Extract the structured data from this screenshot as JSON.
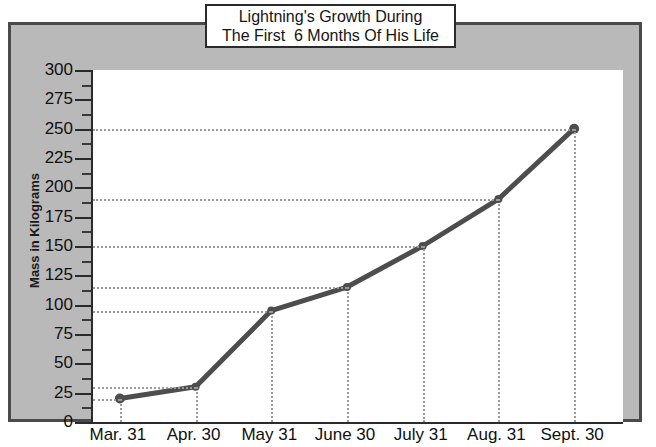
{
  "chart_data": {
    "type": "line",
    "title": "Lightning's Growth During The First  6 Months Of His Life",
    "title_line1": "Lightning's Growth During",
    "title_line2": "The First  6 Months Of His Life",
    "xlabel": "",
    "ylabel": "Mass in Kilograms",
    "categories": [
      "Mar. 31",
      "Apr. 30",
      "May 31",
      "June 30",
      "July 31",
      "Aug. 31",
      "Sept. 30"
    ],
    "values": [
      20,
      30,
      95,
      115,
      150,
      190,
      250
    ],
    "ylim": [
      0,
      300
    ],
    "ytick_labels": [
      "0",
      "25",
      "50",
      "75",
      "100",
      "125",
      "150",
      "175",
      "200",
      "225",
      "250",
      "275",
      "300"
    ],
    "ytick_values": [
      0,
      25,
      50,
      75,
      100,
      125,
      150,
      175,
      200,
      225,
      250,
      275,
      300
    ],
    "ytick_interval": 25,
    "yminor_interval": 12.5,
    "grid": "dotted gridlines drawn from each data point to both axes",
    "legend": "none",
    "series": [
      {
        "name": "Lightning's mass",
        "values": [
          20,
          30,
          95,
          115,
          150,
          190,
          250
        ]
      }
    ],
    "line_color": "#4d4d4d",
    "marker": "circle",
    "plot_background": "#ffffff",
    "panel_background": "#b9b9b9",
    "border_color": "#4a4a4a"
  }
}
